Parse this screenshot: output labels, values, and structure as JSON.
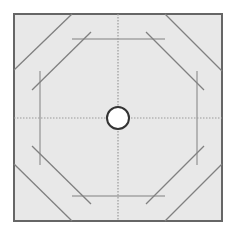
{
  "diagram": {
    "type": "octagonal-fold-pattern",
    "canvas": {
      "width": 235,
      "height": 232,
      "background": "#ffffff"
    },
    "square": {
      "x": 14,
      "y": 14,
      "width": 208,
      "height": 207,
      "fill": "#e8e8e8",
      "stroke": "#666666"
    },
    "center": {
      "cx": 118,
      "cy": 118
    },
    "center_circle": {
      "r": 11,
      "fill": "#ffffff",
      "stroke": "#333333"
    },
    "colors": {
      "line": "#808080",
      "dotted": "#9a9a9a",
      "border": "#666666"
    },
    "crosshair": {
      "style": "dotted"
    },
    "outer_diagonals": [
      {
        "x1": 14,
        "y1": 70,
        "x2": 72,
        "y2": 14
      },
      {
        "x1": 165,
        "y1": 14,
        "x2": 222,
        "y2": 71
      },
      {
        "x1": 14,
        "y1": 164,
        "x2": 72,
        "y2": 221
      },
      {
        "x1": 165,
        "y1": 221,
        "x2": 222,
        "y2": 164
      }
    ],
    "inner_diagonals": [
      {
        "x1": 32,
        "y1": 90,
        "x2": 91,
        "y2": 32
      },
      {
        "x1": 146,
        "y1": 32,
        "x2": 204,
        "y2": 90
      },
      {
        "x1": 32,
        "y1": 146,
        "x2": 91,
        "y2": 204
      },
      {
        "x1": 146,
        "y1": 204,
        "x2": 204,
        "y2": 146
      }
    ],
    "guide_lines": [
      {
        "x1": 72,
        "y1": 39,
        "x2": 165,
        "y2": 39
      },
      {
        "x1": 72,
        "y1": 196,
        "x2": 165,
        "y2": 196
      },
      {
        "x1": 40,
        "y1": 71,
        "x2": 40,
        "y2": 165
      },
      {
        "x1": 197,
        "y1": 71,
        "x2": 197,
        "y2": 165
      }
    ]
  }
}
